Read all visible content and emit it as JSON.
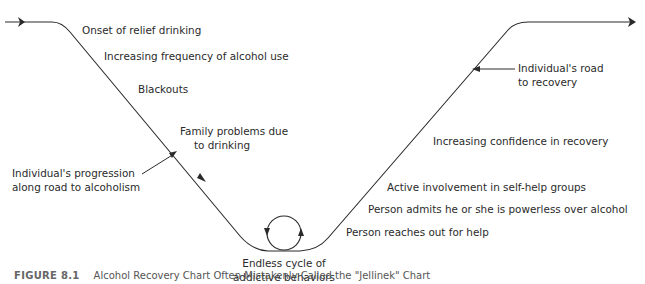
{
  "diagram": {
    "title": "Alcohol Recovery Chart",
    "decline_path": {
      "label": "Individual's progression along road to alcoholism",
      "label_lines": [
        "Individual's progression",
        "along road to alcoholism"
      ],
      "stages": [
        "Onset of relief drinking",
        "Increasing frequency of alcohol use",
        "Blackouts",
        "Family problems due to drinking"
      ],
      "family_lines": [
        "Family problems due",
        "to drinking"
      ]
    },
    "bottom": {
      "label_lines": [
        "Endless cycle of",
        "addictive behaviors"
      ]
    },
    "recovery_path": {
      "label": "Individual's road to recovery",
      "label_lines": [
        "Individual's road",
        "to recovery"
      ],
      "stages": [
        "Person reaches out for help",
        "Person admits he or she is powerless over alcohol",
        "Active involvement in self-help groups",
        "Increasing confidence in recovery"
      ]
    },
    "caption": {
      "figure": "FIGURE 8.1",
      "text": "Alcohol Recovery Chart Often Mistakenly Called the \"Jellinek\" Chart"
    },
    "colors": {
      "line": "#2a2a2a",
      "text": "#2a2a2a",
      "background": "#ffffff"
    }
  }
}
